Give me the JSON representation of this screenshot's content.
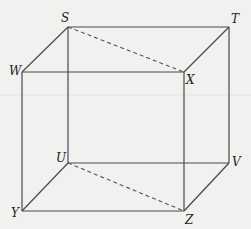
{
  "diagram": {
    "type": "cube",
    "vertices": {
      "S": {
        "label": "S",
        "x": 68,
        "y": 27
      },
      "T": {
        "label": "T",
        "x": 229,
        "y": 27
      },
      "W": {
        "label": "W",
        "x": 22,
        "y": 72
      },
      "X": {
        "label": "X",
        "x": 184,
        "y": 72
      },
      "U": {
        "label": "U",
        "x": 68,
        "y": 163
      },
      "V": {
        "label": "V",
        "x": 229,
        "y": 163
      },
      "Y": {
        "label": "Y",
        "x": 22,
        "y": 211
      },
      "Z": {
        "label": "Z",
        "x": 184,
        "y": 211
      }
    },
    "solid_edges": [
      "ST",
      "SW",
      "TX",
      "WX",
      "SU",
      "TV",
      "WY",
      "XZ",
      "UV",
      "UY",
      "VZ",
      "YZ"
    ],
    "dashed_segments": [
      "SX",
      "UZ"
    ],
    "colors": {
      "line": "#4a4a4a",
      "background": "#f1f1ef"
    }
  }
}
